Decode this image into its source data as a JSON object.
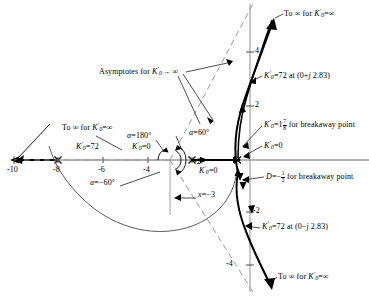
{
  "figure": {
    "type": "root-locus",
    "axes": {
      "real_axis_label": "sigma",
      "imag_axis_label": "j-omega",
      "real_ticks": [
        -10,
        -8,
        -6,
        -4,
        -2
      ],
      "real_tick_labels": [
        "-10",
        "-8",
        "-6",
        "-4",
        "-2"
      ],
      "imag_ticks": [
        4,
        2,
        -2,
        -4
      ],
      "imag_tick_labels": [
        "4",
        "2",
        "-2",
        "-4"
      ],
      "origin_px": {
        "x": 237,
        "y": 160
      },
      "px_per_unit_x": 22.3,
      "px_per_unit_y": 26.5
    },
    "poles": [
      {
        "x": -8,
        "y": 0,
        "marker": "x"
      },
      {
        "x": -2,
        "y": 0,
        "marker": "x"
      },
      {
        "x": 0,
        "y": 0,
        "marker": "x"
      },
      {
        "x": -10,
        "y": 0,
        "marker": "arrow-left"
      }
    ],
    "asymptote_centroid": {
      "x": -3,
      "y": 0
    },
    "asymptote_angles_deg": [
      60,
      180,
      -60
    ],
    "crossings": [
      {
        "label": "K0' = 72 at (0 + j 2.83)",
        "x": 0,
        "y": 2.83
      },
      {
        "label": "K0' = 72 at (0 - j 2.83)",
        "x": 0,
        "y": -2.83
      }
    ],
    "breakaway": {
      "D": -0.5,
      "gain": "1 7/8"
    }
  },
  "labels": {
    "to_inf_upper_right": "To ∞ for",
    "to_inf_lower_right": "To ∞ for",
    "to_inf_left": "To ∞ for",
    "asymptotes": "Asymptotes for",
    "asymptotes_arrow": "→ ∞",
    "gain_symbol": "K",
    "gain_sub": "0",
    "gain_prime": "′",
    "eq_infinity": "=∞",
    "eq_zero": "=0",
    "eq_72": "=72",
    "k72_upper": "=72 at (0+",
    "k72_upper_tail": " 2.83)",
    "k72_lower": "=72 at (0−",
    "k72_lower_tail": " 2.83)",
    "j_italic": "j",
    "breakaway_gain_int": "=1",
    "breakaway_gain_num": "7",
    "breakaway_gain_den": "8",
    "breakaway_gain_tail": "for breakaway point",
    "breakaway_D": "D",
    "breakaway_D_eq": "=−",
    "breakaway_D_num": "1",
    "breakaway_D_den": "2",
    "breakaway_D_tail": "for breakaway point",
    "alpha": "α",
    "alpha_180": "=180°",
    "alpha_60": "=60°",
    "alpha_m60": "=−60°",
    "x_eq": "x",
    "x_eq_val": "=−3",
    "tick_m10": "-10",
    "tick_m8": "-8",
    "tick_m6": "-6",
    "tick_m4": "-4",
    "tick_m2": "-2",
    "tick_p4": "4",
    "tick_p2": "2",
    "tick_n2": "-2",
    "tick_n4": "-4"
  },
  "colors": {
    "ink": "#1a1a1a",
    "axis": "#6b6b6b",
    "locus": "#000000",
    "asymptote": "#8c8c8c",
    "background": "#ffffff"
  }
}
